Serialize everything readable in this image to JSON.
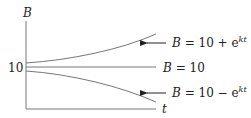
{
  "axes": {
    "y_label": "B",
    "x_label": "t",
    "y_tick": "10"
  },
  "curves": [
    {
      "name": "growth",
      "label_lhs": "B",
      "label_rhs": "10 + e",
      "exponent": "kt"
    },
    {
      "name": "equilibrium",
      "label_lhs": "B",
      "label_rhs": "10"
    },
    {
      "name": "decay",
      "label_lhs": "B",
      "label_rhs": "10 − e",
      "exponent": "kt"
    }
  ],
  "colors": {
    "line": "#777777",
    "text": "#222222"
  }
}
